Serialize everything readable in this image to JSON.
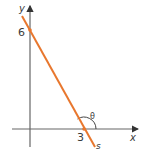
{
  "diagram": {
    "axes": {
      "x_label": "x",
      "y_label": "y",
      "axis_color": "#555555"
    },
    "line": {
      "label": "s",
      "color": "#e8772e",
      "x_intercept": "3",
      "y_intercept": "6"
    },
    "angle": {
      "label": "θ"
    }
  }
}
